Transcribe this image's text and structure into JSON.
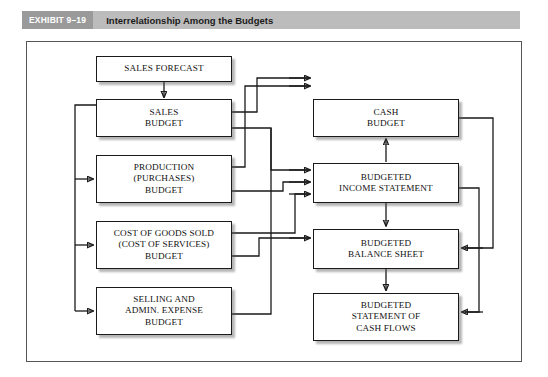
{
  "exhibit": {
    "tag": "EXHIBIT 9–19",
    "title": "Interrelationship Among the Budgets",
    "band_color": "#bcbcbc",
    "tag_color": "#9a9a9a"
  },
  "diagram": {
    "type": "flowchart",
    "nodes": [
      {
        "id": "sales-forecast",
        "label": "SALES FORECAST",
        "column": "left",
        "row": 0
      },
      {
        "id": "sales-budget",
        "label": "SALES\nBUDGET",
        "column": "left",
        "row": 1
      },
      {
        "id": "production",
        "label": "PRODUCTION\n(PURCHASES)\nBUDGET",
        "column": "left",
        "row": 2
      },
      {
        "id": "cogs",
        "label": "COST OF GOODS SOLD\n(COST OF SERVICES)\nBUDGET",
        "column": "left",
        "row": 3
      },
      {
        "id": "sga",
        "label": "SELLING AND\nADMIN. EXPENSE\nBUDGET",
        "column": "left",
        "row": 4
      },
      {
        "id": "cash-budget",
        "label": "CASH\nBUDGET",
        "column": "right",
        "row": 1
      },
      {
        "id": "income-stmt",
        "label": "BUDGETED\nINCOME STATEMENT",
        "column": "right",
        "row": 2
      },
      {
        "id": "balance-sheet",
        "label": "BUDGETED\nBALANCE SHEET",
        "column": "right",
        "row": 3
      },
      {
        "id": "cash-flows",
        "label": "BUDGETED\nSTATEMENT OF\nCASH FLOWS",
        "column": "right",
        "row": 4
      }
    ],
    "edges": [
      {
        "from": "sales-forecast",
        "to": "sales-budget",
        "style": "straight-down"
      },
      {
        "from": "sales-budget",
        "to": "production",
        "style": "left-bus"
      },
      {
        "from": "sales-budget",
        "to": "cogs",
        "style": "left-bus"
      },
      {
        "from": "sales-budget",
        "to": "sga",
        "style": "left-bus"
      },
      {
        "from": "sales-budget",
        "to": "cash-budget",
        "style": "right-route"
      },
      {
        "from": "sales-budget",
        "to": "income-stmt",
        "style": "right-route"
      },
      {
        "from": "production",
        "to": "cash-budget",
        "style": "right-route"
      },
      {
        "from": "production",
        "to": "income-stmt",
        "style": "right-route"
      },
      {
        "from": "cogs",
        "to": "income-stmt",
        "style": "right-route"
      },
      {
        "from": "cogs",
        "to": "balance-sheet",
        "style": "right-route"
      },
      {
        "from": "sga",
        "to": "cash-budget",
        "style": "right-route"
      },
      {
        "from": "income-stmt",
        "to": "cash-budget",
        "style": "straight-up"
      },
      {
        "from": "income-stmt",
        "to": "balance-sheet",
        "style": "straight-down"
      },
      {
        "from": "balance-sheet",
        "to": "cash-flows",
        "style": "straight-down"
      },
      {
        "from": "cash-budget",
        "to": "balance-sheet",
        "style": "far-right-route"
      },
      {
        "from": "income-stmt",
        "to": "cash-flows",
        "style": "far-right-route"
      }
    ]
  }
}
